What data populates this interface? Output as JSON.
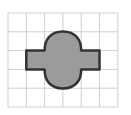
{
  "diagram": {
    "type": "shape-on-grid",
    "grid": {
      "columns": 6,
      "rows": 5,
      "origin_x": 8,
      "origin_y": 13,
      "cell_size": 18.3,
      "line_color": "#cfcfcf"
    },
    "shape": {
      "description": "composite shape: horizontal rectangle with a vertical oval (stadium) centered on it",
      "fill_color": "#9b9b9b",
      "stroke_color": "#333333",
      "rectangle": {
        "col_start": 1,
        "col_end": 5,
        "row_start": 2,
        "row_end": 3
      },
      "oval": {
        "col_start": 2,
        "col_end": 4,
        "row_start": 1,
        "row_end": 4
      }
    }
  }
}
